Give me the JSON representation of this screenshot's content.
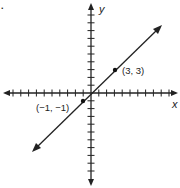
{
  "figure": {
    "corner_mark": ".",
    "x_axis_label": "x",
    "y_axis_label": "y",
    "points": [
      {
        "label": "(3, 3)",
        "x": 3,
        "y": 3
      },
      {
        "label": "(−1, −1)",
        "x": -1,
        "y": -1
      }
    ],
    "line": {
      "equation": "y = x",
      "arrows": "both"
    },
    "grid": {
      "x_range": [
        -11,
        11
      ],
      "y_range": [
        -11,
        11
      ],
      "tick_spacing": 1
    }
  },
  "chart_data": {
    "type": "line",
    "title": "",
    "xlabel": "x",
    "ylabel": "y",
    "series": [
      {
        "name": "line through (-1,-1) and (3,3)",
        "x": [
          -1,
          3
        ],
        "y": [
          -1,
          3
        ]
      }
    ],
    "annotations": [
      "(3, 3)",
      "(−1, −1)"
    ],
    "xlim": [
      -11,
      11
    ],
    "ylim": [
      -11,
      11
    ],
    "grid": false
  }
}
